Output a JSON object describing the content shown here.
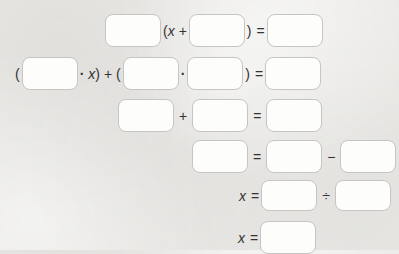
{
  "colors": {
    "page_background": "#e9e8e5",
    "box_border": "#c6c5c2",
    "box_fill": "#fdfdfb",
    "text": "#333333"
  },
  "equation_steps": {
    "row1": {
      "boxes": [
        "",
        "",
        ""
      ],
      "lparen": "(",
      "x": "x",
      "plus": "+",
      "rparen": ")",
      "equals": "="
    },
    "row2": {
      "boxes": [
        "",
        "",
        "",
        ""
      ],
      "lparen": "(",
      "dot1": "·",
      "x": "x",
      "close_plus_open": ") + (",
      "dot2": "·",
      "rparen": ")",
      "equals": "="
    },
    "row3": {
      "boxes": [
        "",
        "",
        ""
      ],
      "plus": "+",
      "equals": "="
    },
    "row4": {
      "boxes": [
        "",
        "",
        ""
      ],
      "equals": "=",
      "minus": "−"
    },
    "row5": {
      "boxes": [
        "",
        ""
      ],
      "x": "x",
      "equals": "=",
      "divide": "÷"
    },
    "row6": {
      "boxes": [
        ""
      ],
      "x": "x",
      "equals": "="
    }
  }
}
